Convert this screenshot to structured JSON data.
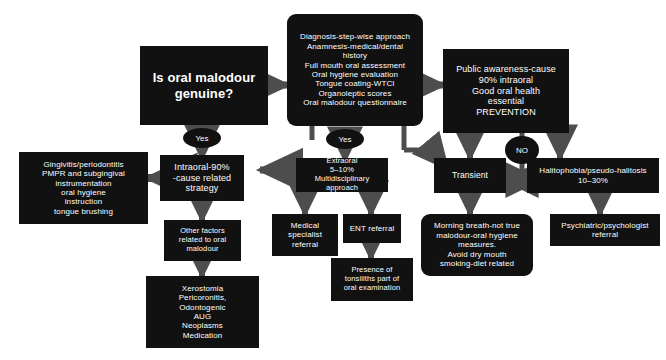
{
  "diagram": {
    "background_color": "#ffffff",
    "node_color": "#111111",
    "text_color": "#ffffff",
    "connector_color": "#4d4d4d"
  },
  "nodes": {
    "start": {
      "label": "Is oral malodour\ngenuine?",
      "shape": "rectangle"
    },
    "diagnosis": {
      "label": "Diagnosis-step-wise approach\nAnamnesis-medical/dental\nhistory\nFull mouth oral assessment\nOral hygiene evaluation\nTongue coating-WTCI\nOrganoleptic scores\nOral malodour questionnaire",
      "shape": "rounded-rectangle"
    },
    "prevention": {
      "label": "Public awareness-cause\n90% intraoral\nGood oral health\nessential\nPREVENTION",
      "shape": "rectangle"
    },
    "intraoral": {
      "label": "Intraoral-90%\n-cause related\nstrategy",
      "shape": "rectangle"
    },
    "gingivitis": {
      "label": "Gingivitis/periodontitis\nPMPR and subgingival\ninstrumentation\noral hygiene\ninstruction\ntongue brushing",
      "shape": "rectangle"
    },
    "other_factors": {
      "label": "Other factors\nrelated to oral\nmalodour",
      "shape": "rectangle"
    },
    "xerostomia": {
      "label": "Xerostomia\nPericoronitis,\nOdontogenic\nAUG\nNeoplasms\nMedication",
      "shape": "rectangle"
    },
    "extraoral": {
      "label": "Extraoral\n5–10%\nMultidisciplinary approach",
      "shape": "rectangle"
    },
    "medical_referral": {
      "label": "Medical\nspecialist\nreferral",
      "shape": "rectangle"
    },
    "ent_referral": {
      "label": "ENT referral",
      "shape": "rectangle"
    },
    "tonsiliths": {
      "label": "Presence of\ntonsiliths part of\noral examination",
      "shape": "rectangle"
    },
    "transient": {
      "label": "Transient",
      "shape": "rectangle"
    },
    "morning_breath": {
      "label": "Morning breath-not true\nmalodour-oral hygiene\nmeasures.\nAvoid dry mouth\nsmoking-diet related",
      "shape": "rounded-rectangle"
    },
    "halitophobia": {
      "label": "Halitophobia/pseudo-halitosis\n10–30%",
      "shape": "rectangle"
    },
    "psychiatric": {
      "label": "Psychiatric/psychologist\nreferral",
      "shape": "rectangle"
    }
  },
  "decisions": {
    "yes_left": {
      "label": "Yes"
    },
    "yes_center": {
      "label": "Yes"
    },
    "no_right": {
      "label": "NO"
    }
  }
}
